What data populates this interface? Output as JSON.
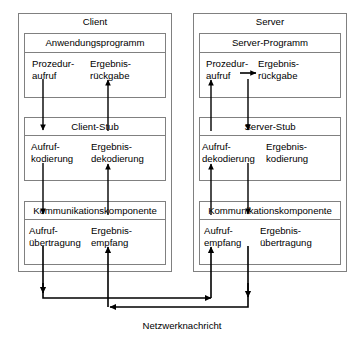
{
  "diagram": {
    "title_semantic": "rpc-client-server-communication-stack",
    "stroke_color": "#000000",
    "outer_border_color": "#808080",
    "background": "#ffffff",
    "bottom_label": "Netzwerknachricht",
    "sides": [
      {
        "id": "client",
        "heading": "Client",
        "layers": [
          {
            "id": "application",
            "header": "Anwendungsprogramm",
            "left_label_line1": "Prozedur-",
            "left_label_line2": "aufruf",
            "right_label_line1": "Ergebnis-",
            "right_label_line2": "rückgabe"
          },
          {
            "id": "stub",
            "header": "Client-Stub",
            "left_label_line1": "Aufruf-",
            "left_label_line2": "kodierung",
            "right_label_line1": "Ergebnis-",
            "right_label_line2": "dekodierung"
          },
          {
            "id": "communication",
            "header": "Kommunikationskomponente",
            "left_label_line1": "Aufruf-",
            "left_label_line2": "übertragung",
            "right_label_line1": "Ergebnis-",
            "right_label_line2": "empfang"
          }
        ]
      },
      {
        "id": "server",
        "heading": "Server",
        "layers": [
          {
            "id": "application",
            "header": "Server-Programm",
            "left_label_line1": "Prozedur-",
            "left_label_line2": "aufruf",
            "right_label_line1": "Ergebnis-",
            "right_label_line2": "rückgabe"
          },
          {
            "id": "stub",
            "header": "Server-Stub",
            "left_label_line1": "Aufruf-",
            "left_label_line2": "dekodierung",
            "right_label_line1": "Ergebnis-",
            "right_label_line2": "kodierung"
          },
          {
            "id": "communication",
            "header": "Kommunikationskomponente",
            "left_label_line1": "Aufruf-",
            "left_label_line2": "empfang",
            "right_label_line1": "Ergebnis-",
            "right_label_line2": "übertragung"
          }
        ]
      }
    ]
  }
}
